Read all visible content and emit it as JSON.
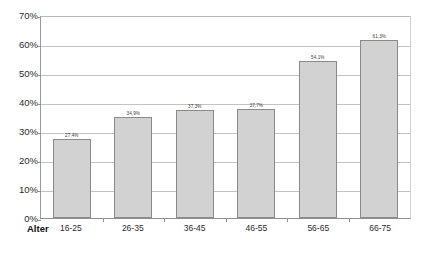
{
  "chart_data": {
    "type": "bar",
    "title": "",
    "xlabel": "Alter",
    "ylabel": "",
    "categories": [
      "16-25",
      "26-35",
      "36-45",
      "46-55",
      "56-65",
      "66-75"
    ],
    "values": [
      27.4,
      34.9,
      37.3,
      37.7,
      54.1,
      61.3
    ],
    "data_labels": [
      "27,4%",
      "34,9%",
      "37,3%",
      "37,7%",
      "54,1%",
      "61,3%"
    ],
    "ylim": [
      0,
      70
    ],
    "ytick_labels": [
      "0%",
      "10%",
      "20%",
      "30%",
      "40%",
      "50%",
      "60%",
      "70%"
    ],
    "ytick_values": [
      0,
      10,
      20,
      30,
      40,
      50,
      60,
      70
    ],
    "grid": true,
    "legend": false,
    "legend_position": "none",
    "series": [
      {
        "name": "",
        "values": [
          27.4,
          34.9,
          37.3,
          37.7,
          54.1,
          61.3
        ]
      }
    ],
    "colors": {
      "bar_fill": "#d2d2d2",
      "bar_border": "#8a8a8a",
      "gridline": "#c3c3c3",
      "axis": "#8f8f8f",
      "text": "#2b2b2b",
      "background": "#ffffff"
    }
  }
}
